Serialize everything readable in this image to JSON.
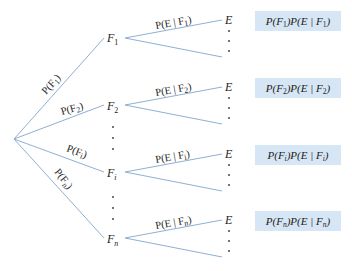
{
  "diagram": {
    "type": "probability-tree",
    "root": "",
    "colors": {
      "edge": "#8fb0d3",
      "box": "#d6e6f4",
      "text": "#222222"
    },
    "first_level": [
      {
        "node": "F1",
        "node_base": "F",
        "node_sub": "1",
        "edge_label": "P(F1)",
        "edge_label_base": "P(F",
        "edge_label_sub": "1",
        "edge_label_end": ")"
      },
      {
        "node": "F2",
        "node_base": "F",
        "node_sub": "2",
        "edge_label": "P(F2)",
        "edge_label_base": "P(F",
        "edge_label_sub": "2",
        "edge_label_end": ")"
      },
      {
        "node": "Fi",
        "node_base": "F",
        "node_sub": "i",
        "edge_label": "P(Fi)",
        "edge_label_base": "P(F",
        "edge_label_sub": "i",
        "edge_label_end": ")"
      },
      {
        "node": "Fn",
        "node_base": "F",
        "node_sub": "n",
        "edge_label": "P(Fn)",
        "edge_label_base": "P(F",
        "edge_label_sub": "n",
        "edge_label_end": ")"
      }
    ],
    "second_level": [
      {
        "edge_label_base": "P(E | F",
        "edge_label_sub": "1",
        "edge_label_end": ")",
        "leaf": "E",
        "product_a": "P(F",
        "product_sub1": "1",
        "product_b": ")P(E | F",
        "product_sub2": "1",
        "product_c": ")"
      },
      {
        "edge_label_base": "P(E | F",
        "edge_label_sub": "2",
        "edge_label_end": ")",
        "leaf": "E",
        "product_a": "P(F",
        "product_sub1": "2",
        "product_b": ")P(E | F",
        "product_sub2": "2",
        "product_c": ")"
      },
      {
        "edge_label_base": "P(E | F",
        "edge_label_sub": "i",
        "edge_label_end": ")",
        "leaf": "E",
        "product_a": "P(F",
        "product_sub1": "i",
        "product_b": ")P(E | F",
        "product_sub2": "i",
        "product_c": ")"
      },
      {
        "edge_label_base": "P(E | F",
        "edge_label_sub": "n",
        "edge_label_end": ")",
        "leaf": "E",
        "product_a": "P(F",
        "product_sub1": "n",
        "product_b": ")P(E | F",
        "product_sub2": "n",
        "product_c": ")"
      }
    ],
    "ellipsis": "⋮"
  }
}
